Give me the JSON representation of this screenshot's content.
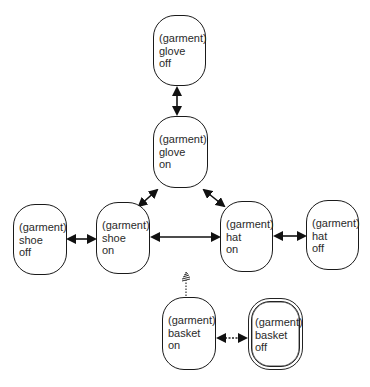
{
  "diagram": {
    "type": "state-transition",
    "nodes": [
      {
        "id": "glove-off",
        "lines": [
          "(garment)",
          "glove",
          "off"
        ],
        "x": 153,
        "y": 15,
        "w": 53,
        "h": 71,
        "style": "normal"
      },
      {
        "id": "glove-on",
        "lines": [
          "(garment)",
          "glove",
          "on"
        ],
        "x": 153,
        "y": 116,
        "w": 55,
        "h": 72,
        "style": "normal"
      },
      {
        "id": "shoe-off",
        "lines": [
          "(garment)",
          "shoe",
          "off"
        ],
        "x": 13,
        "y": 204,
        "w": 54,
        "h": 71,
        "style": "normal"
      },
      {
        "id": "shoe-on",
        "lines": [
          "(garment)",
          "shoe",
          "on"
        ],
        "x": 96,
        "y": 202,
        "w": 54,
        "h": 72,
        "style": "normal"
      },
      {
        "id": "hat-on",
        "lines": [
          "(garment)",
          "hat",
          "on"
        ],
        "x": 220,
        "y": 201,
        "w": 53,
        "h": 71,
        "style": "normal"
      },
      {
        "id": "hat-off",
        "lines": [
          "(garment)",
          "hat",
          "off"
        ],
        "x": 306,
        "y": 200,
        "w": 53,
        "h": 70,
        "style": "normal"
      },
      {
        "id": "basket-on",
        "lines": [
          "(garment)",
          "basket",
          "on"
        ],
        "x": 162,
        "y": 297,
        "w": 54,
        "h": 73,
        "style": "normal"
      },
      {
        "id": "basket-off",
        "lines": [
          "(garment)",
          "basket",
          "off"
        ],
        "x": 248,
        "y": 298,
        "w": 55,
        "h": 72,
        "style": "hatched"
      }
    ],
    "edges": [
      {
        "from": "glove-off",
        "to": "glove-on",
        "direction": "bidirectional",
        "style": "solid"
      },
      {
        "from": "glove-on",
        "to": "shoe-on",
        "direction": "bidirectional",
        "style": "solid"
      },
      {
        "from": "glove-on",
        "to": "hat-on",
        "direction": "bidirectional",
        "style": "solid"
      },
      {
        "from": "shoe-off",
        "to": "shoe-on",
        "direction": "bidirectional",
        "style": "solid"
      },
      {
        "from": "shoe-on",
        "to": "hat-on",
        "direction": "bidirectional",
        "style": "solid"
      },
      {
        "from": "hat-on",
        "to": "hat-off",
        "direction": "bidirectional",
        "style": "solid"
      },
      {
        "from": "basket-on",
        "to": "basket-off",
        "direction": "bidirectional",
        "style": "dashed"
      },
      {
        "from": "basket-on",
        "to": "external",
        "direction": "outgoing",
        "style": "dotted-hatched"
      }
    ]
  }
}
